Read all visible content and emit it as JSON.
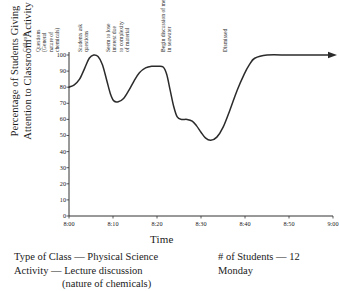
{
  "chart_data": {
    "type": "line",
    "title": "",
    "xlabel": "Time",
    "ylabel": "Percentage of Students Giving Attention to Classroom Activity",
    "ylabel_line1": "Percentage of Students Giving",
    "ylabel_line2": "Attention to Classroom Activity",
    "xlim": [
      480,
      540
    ],
    "ylim": [
      0,
      100
    ],
    "grid": false,
    "legend": "none",
    "xticklabels": [
      "8:00",
      "8:10",
      "8:20",
      "8:30",
      "8:40",
      "8:50",
      "9:00"
    ],
    "xtickvalues": [
      480,
      490,
      500,
      510,
      520,
      530,
      540
    ],
    "yticklabels": [
      "0",
      "10",
      "20",
      "30",
      "40",
      "50",
      "60",
      "70",
      "80",
      "90",
      "100"
    ],
    "ytickvalues": [
      0,
      10,
      20,
      30,
      40,
      50,
      60,
      70,
      80,
      90,
      100
    ],
    "series": [
      {
        "name": "Attention",
        "x": [
          480.0,
          481.2,
          482.4,
          483.6,
          484.6,
          485.6,
          486.6,
          487.6,
          488.6,
          489.4,
          490.2,
          491.2,
          492.4,
          493.6,
          494.8,
          496.0,
          497.4,
          498.8,
          500.2,
          501.4,
          502.2,
          503.0,
          503.8,
          504.6,
          505.6,
          506.8,
          508.0,
          509.0,
          510.0,
          511.0,
          512.2,
          513.6,
          515.0,
          516.6,
          518.2,
          519.8,
          521.0,
          522.2,
          525.0,
          530.0,
          535.0,
          540.0
        ],
        "y": [
          80.0,
          81.5,
          85.0,
          92.0,
          98.0,
          100.0,
          99.0,
          94.0,
          84.0,
          76.0,
          71.5,
          71.0,
          73.0,
          78.0,
          84.0,
          89.0,
          92.0,
          93.0,
          93.0,
          92.5,
          88.0,
          78.0,
          68.0,
          61.5,
          60.0,
          60.0,
          59.0,
          56.0,
          52.0,
          48.5,
          47.0,
          49.0,
          55.0,
          66.0,
          78.0,
          88.0,
          94.0,
          98.0,
          100.0,
          100.0,
          100.0,
          100.0
        ]
      }
    ],
    "end_arrow": true,
    "annotations": [
      {
        "label": "Call roll",
        "x": 481.5,
        "lines": [
          "Call roll"
        ]
      },
      {
        "label": "Questions (General nature of chemicals)",
        "x": 484.5,
        "lines": [
          "Questions",
          "(General",
          "nature of",
          "chemicals)"
        ]
      },
      {
        "label": "Students ask questions",
        "x": 494.0,
        "lines": [
          "Students ask",
          "questions"
        ]
      },
      {
        "label": "Seem to lose interest due to complexity of material",
        "x": 500.5,
        "lines": [
          "Seem to lose",
          "interest due",
          "to complexity",
          "of material"
        ]
      },
      {
        "label": "Begin discussion of metals in seawater",
        "x": 513.0,
        "lines": [
          "Begin discussion of metals",
          "in seawater"
        ]
      },
      {
        "label": "Dismissed",
        "x": 527.0,
        "lines": [
          "Dismissed"
        ]
      }
    ]
  },
  "caption": {
    "type_of_class": "Type of Class — Physical Science",
    "activity": "Activity — Lecture discussion",
    "activity_detail": "(nature of chemicals)",
    "students": "# of Students — 12",
    "day": "Monday"
  },
  "colors": {
    "line": "#2b2b2b",
    "axis": "#333333",
    "text": "#1a1a1a",
    "background": "#ffffff"
  }
}
